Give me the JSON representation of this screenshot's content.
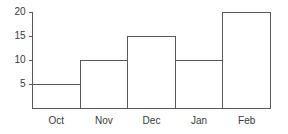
{
  "chart_data": {
    "type": "bar",
    "title": "",
    "subtitle": "",
    "xlabel": "",
    "ylabel": "",
    "categories": [
      "Oct",
      "Nov",
      "Dec",
      "Jan",
      "Feb"
    ],
    "values": [
      5,
      10,
      15,
      10,
      20
    ],
    "ylim": [
      0,
      20
    ],
    "ytick_labels": [
      "20",
      "15",
      "10",
      "5"
    ],
    "yticks": [
      20,
      15,
      10,
      5
    ],
    "grid": false,
    "legend": false,
    "legend_position": "none",
    "bar_style": "outlined",
    "annotations": []
  },
  "style": {
    "background_color": "#ffffff",
    "line_color": "#5a5a5a",
    "text_color": "#3a3a3a",
    "bar_fill": "none"
  },
  "geometry": {
    "plot_left": 32,
    "plot_right": 270,
    "plot_top": 12,
    "baseline_y": 108,
    "pixels_per_unit": 4.8,
    "bar_slot_width": 47.6
  }
}
